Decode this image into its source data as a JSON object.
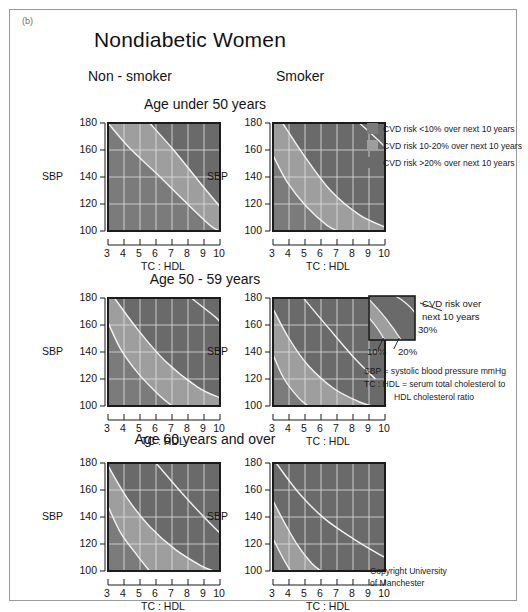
{
  "figure": {
    "panel_label": "(b)",
    "title": "Nondiabetic Women",
    "copyright_line1": "Copyright University",
    "copyright_line2": "of Manchester"
  },
  "columns": [
    {
      "key": "nonsmoker",
      "label": "Non - smoker"
    },
    {
      "key": "smoker",
      "label": "Smoker"
    }
  ],
  "rows": [
    {
      "key": "under50",
      "label": "Age under 50 years"
    },
    {
      "key": "age50_59",
      "label": "Age 50 - 59 years"
    },
    {
      "key": "age60plus",
      "label": "Age 60 years and over"
    }
  ],
  "axes": {
    "y_label": "SBP",
    "y_ticks": [
      "180",
      "160",
      "140",
      "120",
      "100"
    ],
    "y_min": 100,
    "y_max": 180,
    "x_label": "TC : HDL",
    "x_ticks": [
      "3",
      "4",
      "5",
      "6",
      "7",
      "8",
      "9",
      "10"
    ],
    "x_min": 3,
    "x_max": 10
  },
  "legend": {
    "items": [
      {
        "color": "#7b7b7b",
        "label": "CVD risk <10% over next 10 years"
      },
      {
        "color": "#9e9e9e",
        "label": "CVD risk 10-20% over next 10 years"
      },
      {
        "color": "#6a6a6a",
        "label": "CVD risk >20% over next 10 years"
      }
    ]
  },
  "inset": {
    "caption_line1": "CVD risk over",
    "caption_line2": "next 10 years",
    "label_30": "30%",
    "label_10": "10%",
    "label_20": "20%"
  },
  "notes": [
    "SBP = systolic blood pressure mmHg",
    "TC : HDL = serum total cholesterol to",
    "HDL cholesterol ratio"
  ],
  "colors": {
    "band_low": "#7b7b7b",
    "band_mid": "#9e9e9e",
    "band_high": "#6a6a6a",
    "gridline": "#e2e2e2",
    "panel_border": "#1b1b1b",
    "frame": "#9a9a9a"
  },
  "chart_data": {
    "type": "heatmap",
    "title": "Nondiabetic Women",
    "xlabel": "TC : HDL",
    "ylabel": "SBP",
    "xlim": [
      3,
      10
    ],
    "ylim": [
      100,
      180
    ],
    "grid": true,
    "legend_position": "right",
    "band_levels": [
      "<10%",
      "10-20%",
      ">20%",
      "30% contour"
    ],
    "panels": [
      {
        "row": "Age under 50 years",
        "column": "Non - smoker",
        "contours": {
          "c10": [
            [
              3,
              180
            ],
            [
              4.3,
              162
            ],
            [
              6.0,
              143
            ],
            [
              7.8,
              122
            ],
            [
              9.4,
              104
            ],
            [
              10,
              100
            ]
          ],
          "c20": [
            [
              5.6,
              180
            ],
            [
              7.1,
              160
            ],
            [
              8.6,
              138
            ],
            [
              10,
              118
            ]
          ],
          "c30": []
        },
        "dominant_band": "<10%"
      },
      {
        "row": "Age under 50 years",
        "column": "Smoker",
        "contours": {
          "c10": [
            [
              3,
              156
            ],
            [
              3.9,
              136
            ],
            [
              5.1,
              118
            ],
            [
              6.4,
              104
            ],
            [
              7.1,
              100
            ]
          ],
          "c20": [
            [
              3.6,
              180
            ],
            [
              5.0,
              155
            ],
            [
              6.6,
              130
            ],
            [
              8.4,
              112
            ],
            [
              10,
              103
            ]
          ],
          "c30": [
            [
              8.4,
              180
            ],
            [
              9.6,
              167
            ],
            [
              10,
              162
            ]
          ]
        },
        "dominant_band": "10-20%"
      },
      {
        "row": "Age 50 - 59 years",
        "column": "Non - smoker",
        "contours": {
          "c10": [
            [
              3,
              162
            ],
            [
              3.8,
              142
            ],
            [
              4.9,
              124
            ],
            [
              6.2,
              108
            ],
            [
              7.0,
              100
            ]
          ],
          "c20": [
            [
              3.4,
              180
            ],
            [
              4.9,
              156
            ],
            [
              6.6,
              133
            ],
            [
              8.6,
              114
            ],
            [
              10,
              106
            ]
          ],
          "c30": [
            [
              8.2,
              180
            ],
            [
              9.7,
              166
            ],
            [
              10,
              162
            ]
          ]
        },
        "dominant_band": "10-20%"
      },
      {
        "row": "Age 50 - 59 years",
        "column": "Smoker",
        "contours": {
          "c10": [
            [
              3,
              138
            ],
            [
              3.7,
              120
            ],
            [
              4.6,
              106
            ],
            [
              5.2,
              100
            ]
          ],
          "c20": [
            [
              3,
              172
            ],
            [
              4.0,
              150
            ],
            [
              5.2,
              130
            ],
            [
              6.8,
              113
            ],
            [
              8.4,
              103
            ],
            [
              9.2,
              100
            ]
          ],
          "c30": [
            [
              4.9,
              180
            ],
            [
              6.6,
              156
            ],
            [
              8.2,
              134
            ],
            [
              9.4,
              120
            ]
          ]
        },
        "dominant_band": ">20%"
      },
      {
        "row": "Age 60 years and over",
        "column": "Non - smoker",
        "contours": {
          "c10": [
            [
              3,
              148
            ],
            [
              3.8,
              128
            ],
            [
              4.8,
              112
            ],
            [
              5.6,
              100
            ]
          ],
          "c20": [
            [
              3,
              178
            ],
            [
              4.2,
              154
            ],
            [
              5.6,
              133
            ],
            [
              7.2,
              116
            ],
            [
              8.8,
              104
            ],
            [
              9.6,
              100
            ]
          ],
          "c30": [
            [
              6.0,
              180
            ],
            [
              7.6,
              158
            ],
            [
              9.0,
              140
            ],
            [
              10,
              128
            ]
          ]
        },
        "dominant_band": ">20%"
      },
      {
        "row": "Age 60 years and over",
        "column": "Smoker",
        "contours": {
          "c10": [
            [
              3,
              124
            ],
            [
              3.6,
              110
            ],
            [
              4.1,
              100
            ]
          ],
          "c20": [
            [
              3,
              152
            ],
            [
              3.8,
              134
            ],
            [
              4.6,
              118
            ],
            [
              5.4,
              106
            ],
            [
              6.0,
              100
            ]
          ],
          "c30": [
            [
              3.2,
              180
            ],
            [
              4.6,
              158
            ],
            [
              6.2,
              139
            ],
            [
              8.0,
              124
            ],
            [
              9.4,
              114
            ],
            [
              10,
              110
            ]
          ]
        },
        "dominant_band": ">20%"
      }
    ]
  }
}
